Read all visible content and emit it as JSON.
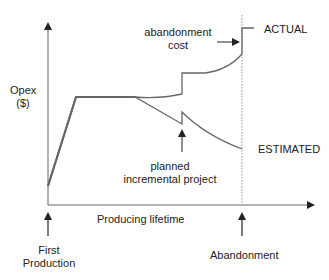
{
  "diagram": {
    "y_axis_label_line1": "Opex",
    "y_axis_label_line2": "($)",
    "x_axis_label": "Producing lifetime",
    "first_production_line1": "First",
    "first_production_line2": "Production",
    "abandonment_label": "Abandonment",
    "abandonment_cost_line1": "abandonment",
    "abandonment_cost_line2": "cost",
    "planned_line1": "planned",
    "planned_line2": "incremental project",
    "actual_label": "ACTUAL",
    "estimated_label": "ESTIMATED",
    "colors": {
      "curve": "#666666",
      "axis": "#555555",
      "text": "#222222",
      "dashed": "#999999"
    }
  }
}
